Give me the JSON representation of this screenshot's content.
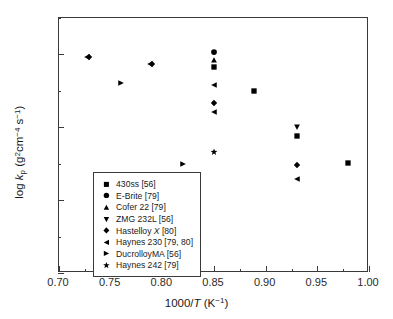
{
  "chart_data": {
    "type": "scatter",
    "title": "",
    "xlabel": "1000/T (K^-1)",
    "ylabel": "log k_p (g2cm-4 s-1)",
    "xlim": [
      0.7,
      1.0
    ],
    "ylim": [
      -15,
      -11.5
    ],
    "grid": false,
    "legend_position": "lower-left-inside",
    "xticks": [
      "0.70",
      "0.75",
      "0.80",
      "0.85",
      "0.90",
      "0.95",
      "1.00"
    ],
    "xtick_values": [
      0.7,
      0.75,
      0.8,
      0.85,
      0.9,
      0.95,
      1.0
    ],
    "xminor_values": [
      0.725,
      0.775,
      0.825,
      0.875,
      0.925,
      0.975
    ],
    "yticks": [
      "-12",
      "-13",
      "-14",
      "-15"
    ],
    "ytick_values": [
      -12,
      -13,
      -14,
      -15
    ],
    "yminor_values": [
      -11.5,
      -12.5,
      -13.5,
      -14.5
    ],
    "series": [
      {
        "name": "430ss [56]",
        "marker": "square",
        "color": "#000000",
        "points": [
          {
            "x": 0.85,
            "y": -12.17
          },
          {
            "x": 0.889,
            "y": -12.5
          },
          {
            "x": 0.93,
            "y": -13.12
          },
          {
            "x": 0.98,
            "y": -13.49
          }
        ]
      },
      {
        "name": "E-Brite [79]",
        "marker": "circle",
        "color": "#000000",
        "points": [
          {
            "x": 0.85,
            "y": -11.96
          }
        ]
      },
      {
        "name": "Cofer 22 [79]",
        "marker": "triangle-up",
        "color": "#000000",
        "points": [
          {
            "x": 0.85,
            "y": -12.08
          }
        ]
      },
      {
        "name": "ZMG 232L [56]",
        "marker": "triangle-down",
        "color": "#000000",
        "points": [
          {
            "x": 0.93,
            "y": -13.0
          }
        ]
      },
      {
        "name": "Hastelloy X [80]",
        "marker": "diamond",
        "color": "#000000",
        "points": [
          {
            "x": 0.729,
            "y": -12.03
          },
          {
            "x": 0.79,
            "y": -12.13
          },
          {
            "x": 0.85,
            "y": -12.67
          },
          {
            "x": 0.93,
            "y": -13.52
          }
        ]
      },
      {
        "name": "Haynes 230 [79, 80]",
        "marker": "triangle-left",
        "color": "#000000",
        "points": [
          {
            "x": 0.727,
            "y": -12.03
          },
          {
            "x": 0.788,
            "y": -12.13
          },
          {
            "x": 0.85,
            "y": -12.42
          },
          {
            "x": 0.85,
            "y": -12.79
          },
          {
            "x": 0.93,
            "y": -13.71
          }
        ]
      },
      {
        "name": "DucrolloyMA [56]",
        "marker": "triangle-right",
        "color": "#000000",
        "points": [
          {
            "x": 0.76,
            "y": -12.39
          },
          {
            "x": 0.82,
            "y": -13.5
          }
        ]
      },
      {
        "name": "Haynes 242 [79]",
        "marker": "star",
        "color": "#000000",
        "points": [
          {
            "x": 0.85,
            "y": -13.34
          }
        ]
      }
    ]
  },
  "legend": {
    "items": [
      {
        "label": "430ss [56]",
        "marker": "square"
      },
      {
        "label": "E-Brite [79]",
        "marker": "circle"
      },
      {
        "label": "Cofer 22 [79]",
        "marker": "triangle-up"
      },
      {
        "label": "ZMG 232L [56]",
        "marker": "triangle-down"
      },
      {
        "label": "Hastelloy X [80]",
        "marker": "diamond"
      },
      {
        "label": "Haynes 230 [79, 80]",
        "marker": "triangle-left"
      },
      {
        "label": "DucrolloyMA [56]",
        "marker": "triangle-right"
      },
      {
        "label": "Haynes 242 [79]",
        "marker": "star"
      }
    ]
  },
  "axis_titles": {
    "x": "1000/T (K−1)",
    "y": "log kₚ (g²cm⁻⁴ s⁻¹)"
  }
}
